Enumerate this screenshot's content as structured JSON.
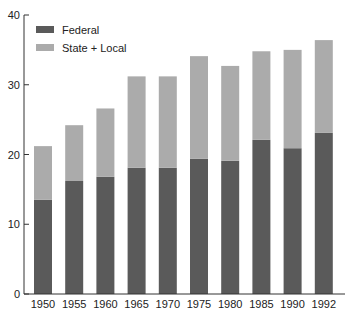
{
  "chart_data": {
    "type": "bar",
    "stacked": true,
    "title": "",
    "xlabel": "",
    "ylabel": "",
    "ylim": [
      0,
      40
    ],
    "yticks": [
      0,
      10,
      20,
      30,
      40
    ],
    "grid": false,
    "legend_position": "upper-left",
    "categories": [
      "1950",
      "1955",
      "1960",
      "1965",
      "1970",
      "1975",
      "1980",
      "1985",
      "1990",
      "1992"
    ],
    "series": [
      {
        "name": "Federal",
        "color": "#5a5a5a",
        "values": [
          13.5,
          16.2,
          16.8,
          18.1,
          18.1,
          19.4,
          19.1,
          22.1,
          20.9,
          23.1
        ]
      },
      {
        "name": "State + Local",
        "color": "#ababab",
        "values": [
          7.7,
          8.0,
          9.8,
          13.1,
          13.1,
          14.7,
          13.6,
          12.7,
          14.1,
          13.3
        ]
      }
    ],
    "totals": [
      21.2,
      24.2,
      26.6,
      31.2,
      31.2,
      34.1,
      32.7,
      34.8,
      35.0,
      36.4
    ]
  },
  "legend": {
    "items": [
      {
        "label": "Federal",
        "color": "#5a5a5a"
      },
      {
        "label": "State + Local",
        "color": "#ababab"
      }
    ]
  }
}
